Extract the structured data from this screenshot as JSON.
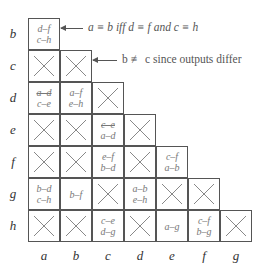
{
  "diagram": {
    "type": "implication-table",
    "row_labels": [
      "b",
      "c",
      "d",
      "e",
      "f",
      "g",
      "h"
    ],
    "col_labels": [
      "a",
      "b",
      "c",
      "d",
      "e",
      "f",
      "g"
    ],
    "cells": {
      "b-a": {
        "x": false,
        "lines": [
          "d–f",
          "c–h"
        ]
      },
      "c-a": {
        "x": true
      },
      "c-b": {
        "x": true
      },
      "d-a": {
        "x": false,
        "lines": [
          "a–d",
          "c–e"
        ],
        "struck": [
          0
        ]
      },
      "d-b": {
        "x": false,
        "lines": [
          "a–f",
          "e–h"
        ]
      },
      "d-c": {
        "x": true
      },
      "e-a": {
        "x": true
      },
      "e-b": {
        "x": true
      },
      "e-c": {
        "x": false,
        "lines": [
          "c–e",
          "a–d"
        ],
        "struck": [
          0
        ]
      },
      "e-d": {
        "x": true
      },
      "f-a": {
        "x": true
      },
      "f-b": {
        "x": true
      },
      "f-c": {
        "x": false,
        "lines": [
          "e–f",
          "b–d"
        ]
      },
      "f-d": {
        "x": true
      },
      "f-e": {
        "x": false,
        "lines": [
          "c–f",
          "a–b"
        ]
      },
      "g-a": {
        "x": false,
        "lines": [
          "b–d",
          "c–h"
        ]
      },
      "g-b": {
        "x": false,
        "lines": [
          "b–f"
        ]
      },
      "g-c": {
        "x": true
      },
      "g-d": {
        "x": false,
        "lines": [
          "a–b",
          "e–h"
        ]
      },
      "g-e": {
        "x": true
      },
      "g-f": {
        "x": true
      },
      "h-a": {
        "x": true
      },
      "h-b": {
        "x": true
      },
      "h-c": {
        "x": false,
        "lines": [
          "c–e",
          "d–g"
        ]
      },
      "h-d": {
        "x": true
      },
      "h-e": {
        "x": false,
        "lines": [
          "a–g"
        ]
      },
      "h-f": {
        "x": false,
        "lines": [
          "c–f",
          "b–g"
        ]
      },
      "h-g": {
        "x": true
      }
    },
    "annotations": [
      {
        "text": "a ≡ b iff d ≡ f and c ≡ h",
        "points_to": "b-a"
      },
      {
        "text": "b ≢ c since outputs differ",
        "points_to": "c-b"
      }
    ]
  }
}
